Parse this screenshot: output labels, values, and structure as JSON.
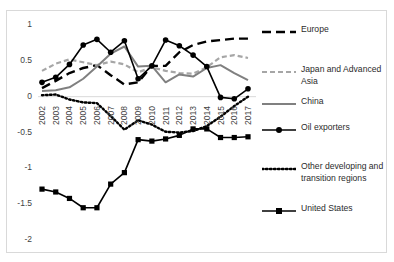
{
  "chart_data": {
    "type": "line",
    "title": "",
    "xlabel": "",
    "ylabel": "",
    "ylim": [
      -2,
      1
    ],
    "yticks": [
      1,
      0.5,
      0,
      -0.5,
      -1,
      -1.5,
      -2
    ],
    "ytick_labels": [
      "1",
      "0.5",
      "0",
      "-0.5",
      "-1",
      "-1.5",
      "-2"
    ],
    "grid": false,
    "legend_position": "right",
    "categories": [
      "2002",
      "2003",
      "2004",
      "2005",
      "2006",
      "2007",
      "2008",
      "2009",
      "2010",
      "2011",
      "2012",
      "2013",
      "2014",
      "2015",
      "2016",
      "2017"
    ],
    "series": [
      {
        "name": "Europe",
        "style": "dashed-long",
        "color": "#000000",
        "marker": "none",
        "values": [
          0.12,
          0.22,
          0.33,
          0.4,
          0.44,
          0.3,
          0.17,
          0.2,
          0.43,
          0.43,
          0.62,
          0.72,
          0.77,
          0.79,
          0.81,
          0.81
        ]
      },
      {
        "name": "Japan and Advanced Asia",
        "style": "dashed-short",
        "color": "#a6a6a6",
        "marker": "none",
        "values": [
          0.36,
          0.46,
          0.52,
          0.48,
          0.44,
          0.49,
          0.45,
          0.34,
          0.41,
          0.36,
          0.33,
          0.32,
          0.41,
          0.55,
          0.58,
          0.54
        ]
      },
      {
        "name": "China",
        "style": "solid",
        "color": "#808080",
        "marker": "none",
        "values": [
          0.08,
          0.09,
          0.13,
          0.25,
          0.42,
          0.6,
          0.7,
          0.42,
          0.43,
          0.2,
          0.31,
          0.28,
          0.4,
          0.44,
          0.33,
          0.23
        ]
      },
      {
        "name": "Oil exporters",
        "style": "solid-marker",
        "color": "#000000",
        "marker": "circle",
        "values": [
          0.2,
          0.27,
          0.45,
          0.72,
          0.8,
          0.62,
          0.78,
          0.25,
          0.43,
          0.79,
          0.71,
          0.58,
          0.42,
          -0.01,
          -0.03,
          0.11
        ]
      },
      {
        "name": "Other developing and transition regions",
        "style": "dotted",
        "color": "#000000",
        "marker": "none",
        "values": [
          0.02,
          0.03,
          -0.04,
          -0.08,
          -0.09,
          -0.27,
          -0.46,
          -0.33,
          -0.39,
          -0.49,
          -0.5,
          -0.48,
          -0.41,
          -0.28,
          -0.13,
          0.0
        ]
      },
      {
        "name": "United States",
        "style": "solid-marker",
        "color": "#000000",
        "marker": "square",
        "values": [
          -1.29,
          -1.33,
          -1.42,
          -1.55,
          -1.55,
          -1.22,
          -1.06,
          -0.6,
          -0.62,
          -0.59,
          -0.54,
          -0.45,
          -0.45,
          -0.57,
          -0.57,
          -0.56
        ]
      }
    ]
  },
  "axis": {
    "y_tick_labels": [
      "1",
      "0.5",
      "0",
      "-0.5",
      "-1",
      "-1.5",
      "-2"
    ],
    "x_tick_labels": [
      "2002",
      "2003",
      "2004",
      "2005",
      "2006",
      "2007",
      "2008",
      "2009",
      "2010",
      "2011",
      "2012",
      "2013",
      "2014",
      "2015",
      "2016",
      "2017"
    ]
  },
  "legend": {
    "items": [
      {
        "label": "Europe",
        "key": "dashed-long-black-key"
      },
      {
        "label": "Japan and Advanced\nAsia",
        "key": "dashed-short-gray-key"
      },
      {
        "label": "China",
        "key": "solid-gray-key"
      },
      {
        "label": "Oil exporters",
        "key": "solid-black-circle-marker-key"
      },
      {
        "label": "Other developing and\ntransition regions",
        "key": "dotted-black-key"
      },
      {
        "label": "United States",
        "key": "solid-black-square-marker-key"
      }
    ]
  },
  "colors": {
    "black": "#000000",
    "gray": "#808080",
    "light_gray": "#a6a6a6",
    "border": "#d9d9d9"
  }
}
